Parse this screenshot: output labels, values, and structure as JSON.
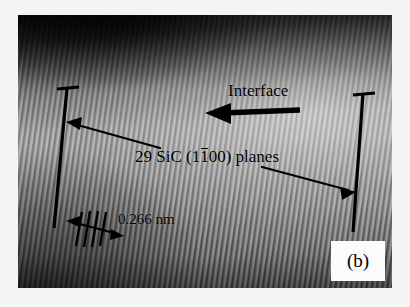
{
  "figure": {
    "panel_label": "(b)",
    "technique": "HRTEM lattice image",
    "background_color": "#f4f4f4",
    "annotation_color": "#000000"
  },
  "micrograph": {
    "description": "High-resolution transmission electron micrograph showing resolved SiC lattice fringes with a dark interface band across the upper region",
    "fringe_tilt_degrees": 8,
    "fringe_period_px": 5.2
  },
  "annotations": {
    "interface": {
      "label": "Interface",
      "arrow_direction": "left"
    },
    "planes": {
      "count": "29",
      "material": "SiC",
      "miller_index_prefix": "(1",
      "miller_index_barred": "1",
      "miller_index_suffix": "00)",
      "label_full": "29 SiC (1100) planes",
      "label_lead": "29 SiC (1",
      "label_tail": "00) planes"
    },
    "spacing": {
      "value": "0.266",
      "unit": "nm",
      "label": "0.266 nm"
    }
  }
}
